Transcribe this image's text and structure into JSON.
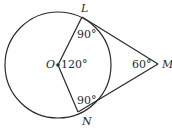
{
  "diagram": {
    "type": "geometry-circle-tangents",
    "points": {
      "O": {
        "label": "O"
      },
      "L": {
        "label": "L"
      },
      "N": {
        "label": "N"
      },
      "M": {
        "label": "M"
      }
    },
    "angles": {
      "OLM": "90°",
      "ONM": "90°",
      "LON": "120°",
      "LMN": "60°"
    },
    "colors": {
      "stroke": "#2a2a2a",
      "background": "#ffffff"
    }
  }
}
